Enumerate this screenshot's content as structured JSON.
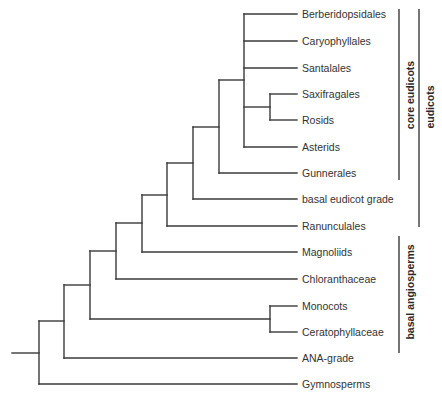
{
  "diagram": {
    "type": "phylogenetic-tree",
    "line_color": "#3a3a3a",
    "text_color": "#333333",
    "taxa": [
      {
        "id": "berberidopsidales",
        "label": "Berberidopsidales",
        "y": 14
      },
      {
        "id": "caryophyllales",
        "label": "Caryophyllales",
        "y": 41
      },
      {
        "id": "santalales",
        "label": "Santalales",
        "y": 68
      },
      {
        "id": "saxifragales",
        "label": "Saxifragales",
        "y": 94
      },
      {
        "id": "rosids",
        "label": "Rosids",
        "y": 120
      },
      {
        "id": "asterids",
        "label": "Asterids",
        "y": 147
      },
      {
        "id": "gunnerales",
        "label": "Gunnerales",
        "y": 173
      },
      {
        "id": "basal-eudicot-grade",
        "label": "basal eudicot grade",
        "y": 199
      },
      {
        "id": "ranunculales",
        "label": "Ranunculales",
        "y": 226
      },
      {
        "id": "magnoliids",
        "label": "Magnoliids",
        "y": 252
      },
      {
        "id": "chloranthaceae",
        "label": "Chloranthaceae",
        "y": 279
      },
      {
        "id": "monocots",
        "label": "Monocots",
        "y": 306
      },
      {
        "id": "ceratophyllaceae",
        "label": "Ceratophyllaceae",
        "y": 332
      },
      {
        "id": "ana-grade",
        "label": "ANA-grade",
        "y": 358
      },
      {
        "id": "gymnosperms",
        "label": "Gymnosperms",
        "y": 384
      }
    ],
    "tip_x": 297,
    "label_x": 302,
    "nodes": [
      {
        "id": "saxifragales-rosids",
        "x": 270,
        "y_top": 94,
        "y_bottom": 120,
        "join_y": 107,
        "children": [
          "saxifragales",
          "rosids"
        ]
      },
      {
        "id": "core-eudicots",
        "x": 244,
        "y_top": 14,
        "y_bottom": 147,
        "join_y": 80,
        "children": [
          "berberidopsidales",
          "caryophyllales",
          "santalales",
          "saxifragales-rosids",
          "asterids"
        ]
      },
      {
        "id": "core-plus-gunnerales",
        "x": 219,
        "y_top": 80,
        "y_bottom": 173,
        "join_y": 127,
        "children": [
          "core-eudicots",
          "gunnerales"
        ]
      },
      {
        "id": "plus-basal-eudicot",
        "x": 193,
        "y_top": 127,
        "y_bottom": 199,
        "join_y": 163,
        "children": [
          "core-plus-gunnerales",
          "basal-eudicot-grade"
        ]
      },
      {
        "id": "eudicots",
        "x": 167,
        "y_top": 163,
        "y_bottom": 226,
        "join_y": 195,
        "children": [
          "plus-basal-eudicot",
          "ranunculales"
        ]
      },
      {
        "id": "plus-magnoliids",
        "x": 142,
        "y_top": 195,
        "y_bottom": 252,
        "join_y": 223,
        "children": [
          "eudicots",
          "magnoliids"
        ]
      },
      {
        "id": "plus-chloranthaceae",
        "x": 116,
        "y_top": 223,
        "y_bottom": 279,
        "join_y": 251,
        "children": [
          "plus-magnoliids",
          "chloranthaceae"
        ]
      },
      {
        "id": "monocots-ceratophyllaceae",
        "x": 270,
        "y_top": 306,
        "y_bottom": 332,
        "join_y": 319,
        "children": [
          "monocots",
          "ceratophyllaceae"
        ]
      },
      {
        "id": "mesangiosperms",
        "x": 90,
        "y_top": 251,
        "y_bottom": 319,
        "join_y": 285,
        "children": [
          "plus-chloranthaceae",
          "monocots-ceratophyllaceae"
        ]
      },
      {
        "id": "angiosperms",
        "x": 64,
        "y_top": 285,
        "y_bottom": 358,
        "join_y": 321,
        "children": [
          "mesangiosperms",
          "ana-grade"
        ]
      },
      {
        "id": "seed-plants",
        "x": 39,
        "y_top": 321,
        "y_bottom": 384,
        "join_y": 353,
        "children": [
          "angiosperms",
          "gymnosperms"
        ]
      }
    ],
    "root_stub": {
      "x1": 12,
      "x2": 39,
      "y": 353
    },
    "groups": [
      {
        "id": "core-eudicots",
        "label": "core eudicots",
        "line_x": 399,
        "y_top": 9,
        "y_bottom": 180,
        "label_x": 410,
        "label_y": 95
      },
      {
        "id": "eudicots",
        "label": "eudicots",
        "line_x": 419,
        "y_top": 9,
        "y_bottom": 227,
        "label_x": 430,
        "label_y": 107
      },
      {
        "id": "basal-angiosperms",
        "label": "basal angiosperms",
        "line_x": 399,
        "y_top": 236,
        "y_bottom": 353,
        "label_x": 410,
        "label_y": 292
      }
    ]
  }
}
